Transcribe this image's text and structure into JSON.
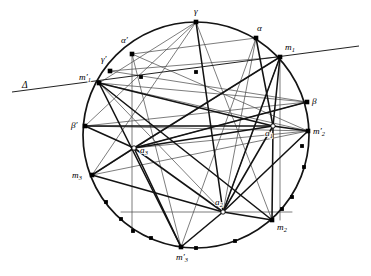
{
  "figure": {
    "background_color": "#ffffff",
    "ink_color": "#131313",
    "thin_ink_color": "#4a4a4a",
    "circle": {
      "cx": 196,
      "cy": 135,
      "r": 113
    },
    "secant": {
      "name": "Delta",
      "label": "Δ",
      "label_x": 22,
      "label_y": 88,
      "x1": 12,
      "y1": 92,
      "x2": 359,
      "y2": 46
    },
    "points": [
      {
        "id": "gamma",
        "label": "γ",
        "sub": "",
        "x": 196,
        "y": 22,
        "lx": 194,
        "ly": 14,
        "marker": "solid"
      },
      {
        "id": "alpha",
        "label": "α",
        "sub": "",
        "x": 256,
        "y": 38,
        "lx": 257,
        "ly": 31,
        "marker": "solid"
      },
      {
        "id": "m1",
        "label": "m",
        "sub": "1",
        "x": 280,
        "y": 57,
        "lx": 285,
        "ly": 50,
        "marker": "solid"
      },
      {
        "id": "beta",
        "label": "β",
        "sub": "",
        "x": 307,
        "y": 102,
        "lx": 312,
        "ly": 104,
        "marker": "solid"
      },
      {
        "id": "m2prime",
        "label": "m′",
        "sub": "2",
        "x": 308,
        "y": 131,
        "lx": 313,
        "ly": 134,
        "marker": "solid"
      },
      {
        "id": "m2",
        "label": "m",
        "sub": "2",
        "x": 272,
        "y": 220,
        "lx": 277,
        "ly": 230,
        "marker": "solid"
      },
      {
        "id": "m3prime",
        "label": "m′",
        "sub": "3",
        "x": 181,
        "y": 247,
        "lx": 176,
        "ly": 260,
        "marker": "solid"
      },
      {
        "id": "m3",
        "label": "m",
        "sub": "3",
        "x": 92,
        "y": 175,
        "lx": 72,
        "ly": 178,
        "marker": "solid"
      },
      {
        "id": "betaprime",
        "label": "β′",
        "sub": "",
        "x": 85,
        "y": 126,
        "lx": 71,
        "ly": 128,
        "marker": "solid"
      },
      {
        "id": "m1prime",
        "label": "m′",
        "sub": "1",
        "x": 99,
        "y": 83,
        "lx": 79,
        "ly": 80,
        "marker": "solid"
      },
      {
        "id": "gammaprime",
        "label": "γ′",
        "sub": "",
        "x": 110,
        "y": 71,
        "lx": 101,
        "ly": 62,
        "marker": "solid"
      },
      {
        "id": "alphaprime",
        "label": "α′",
        "sub": "",
        "x": 132,
        "y": 54,
        "lx": 121,
        "ly": 43,
        "marker": "solid"
      },
      {
        "id": "a1",
        "label": "a",
        "sub": "1",
        "x": 273,
        "y": 126,
        "lx": 265,
        "ly": 136,
        "marker": "open"
      },
      {
        "id": "a2",
        "label": "a",
        "sub": "2",
        "x": 223,
        "y": 212,
        "lx": 215,
        "ly": 205,
        "marker": "open"
      },
      {
        "id": "a3",
        "label": "a",
        "sub": "3",
        "x": 134,
        "y": 148,
        "lx": 140,
        "ly": 153,
        "marker": "open"
      }
    ],
    "minor_points": [
      {
        "id": "p-top-inner-left",
        "x": 141,
        "y": 77
      },
      {
        "id": "p-top-inner-mid",
        "x": 196,
        "y": 72
      },
      {
        "id": "p-right-upper",
        "x": 302,
        "y": 146
      },
      {
        "id": "p-right-mid",
        "x": 304,
        "y": 167
      },
      {
        "id": "p-right-low",
        "x": 292,
        "y": 197
      },
      {
        "id": "p-right-low2",
        "x": 282,
        "y": 209
      },
      {
        "id": "p-bottom-right",
        "x": 235,
        "y": 241
      },
      {
        "id": "p-bottom-mid",
        "x": 196,
        "y": 248
      },
      {
        "id": "p-bottom-left",
        "x": 151,
        "y": 238
      },
      {
        "id": "p-lower-left",
        "x": 121,
        "y": 219
      },
      {
        "id": "p-lower-left2",
        "x": 106,
        "y": 202
      },
      {
        "id": "p-left-low",
        "x": 133,
        "y": 231
      }
    ],
    "chords_thick": [
      {
        "from": "m1prime",
        "to": "a1",
        "id": "c-m1p-a1"
      },
      {
        "from": "m1prime",
        "to": "m2",
        "id": "c-m1p-m2"
      },
      {
        "from": "m1prime",
        "to": "m3prime",
        "id": "c-m1p-m3p"
      },
      {
        "from": "m1",
        "to": "a1",
        "id": "c-m1-a1"
      },
      {
        "from": "m1",
        "to": "a2",
        "id": "c-m1-a2"
      },
      {
        "from": "m1",
        "to": "a3",
        "id": "c-m1-a3"
      },
      {
        "from": "m2prime",
        "to": "a1",
        "id": "c-m2p-a1"
      },
      {
        "from": "m2prime",
        "to": "a2",
        "id": "c-m2p-a2"
      },
      {
        "from": "m2",
        "to": "a2",
        "id": "c-m2-a2"
      },
      {
        "from": "m2",
        "to": "a1",
        "id": "c-m2-a1"
      },
      {
        "from": "m3",
        "to": "a3",
        "id": "c-m3-a3"
      },
      {
        "from": "m3",
        "to": "a2",
        "id": "c-m3-a2"
      },
      {
        "from": "m3prime",
        "to": "a2",
        "id": "c-m3p-a2"
      },
      {
        "from": "m3prime",
        "to": "a3",
        "id": "c-m3p-a3"
      },
      {
        "from": "betaprime",
        "to": "a3",
        "id": "c-bp-a3"
      },
      {
        "from": "betaprime",
        "to": "a1",
        "id": "c-bp-a1"
      },
      {
        "from": "beta",
        "to": "a3",
        "id": "c-b-a3"
      },
      {
        "from": "alpha",
        "to": "a1",
        "id": "c-a-a1"
      },
      {
        "from": "gamma",
        "to": "a2",
        "id": "c-g-a2"
      },
      {
        "from": "a1",
        "to": "a2",
        "id": "c-a1-a2"
      },
      {
        "from": "a2",
        "to": "a3",
        "id": "c-a2-a3"
      },
      {
        "from": "a3",
        "to": "a1",
        "id": "c-a3-a1"
      }
    ],
    "chords_thin": [
      {
        "from": "alphaprime",
        "to": "alpha",
        "id": "t-ap-a"
      },
      {
        "from": "alphaprime",
        "to": "m2prime",
        "id": "t-ap-m2p"
      },
      {
        "from": "alphaprime",
        "to": "m3prime",
        "id": "t-ap-m3p"
      },
      {
        "from": "gammaprime",
        "to": "beta",
        "id": "t-gp-b"
      },
      {
        "from": "gammaprime",
        "to": "m1",
        "id": "t-gp-m1"
      },
      {
        "from": "gamma",
        "to": "m1prime",
        "id": "t-g-m1p"
      },
      {
        "from": "gamma",
        "to": "betaprime",
        "id": "t-g-bp"
      },
      {
        "from": "gamma",
        "to": "m2",
        "id": "t-g-m2"
      },
      {
        "from": "gamma",
        "to": "m3",
        "id": "t-g-m3"
      },
      {
        "from": "alpha",
        "to": "m3prime",
        "id": "t-a-m3p"
      },
      {
        "from": "alpha",
        "to": "a2",
        "id": "t-a-a2"
      },
      {
        "from": "beta",
        "to": "m1prime",
        "id": "t-b-m1p"
      },
      {
        "from": "beta",
        "to": "betaprime",
        "id": "t-b-bp"
      },
      {
        "from": "betaprime",
        "to": "m2prime",
        "id": "t-bp-m2p"
      },
      {
        "from": "m1prime",
        "to": "m2prime",
        "id": "t-m1p-m2p"
      },
      {
        "from": "m1prime",
        "to": "a2",
        "id": "t-m1p-a2"
      },
      {
        "from": "m3",
        "to": "m1",
        "id": "t-m3-m1"
      },
      {
        "from": "m3",
        "to": "m2prime",
        "id": "t-m3-m2p"
      },
      {
        "from": "a3",
        "to": "m2prime",
        "id": "t-a3-m2p"
      },
      {
        "from": "a3",
        "to": "beta",
        "id": "t-a3-b"
      },
      {
        "from": "a2",
        "to": "m1",
        "id": "t-a2-m1"
      }
    ],
    "vertical_guides": [
      {
        "id": "v-alphaprime",
        "x": 132,
        "y1": 54,
        "y2": 231
      },
      {
        "id": "v-m1",
        "x": 280,
        "y1": 57,
        "y2": 220
      }
    ],
    "horizontal_guides": [
      {
        "id": "h-a2",
        "y": 212,
        "x1": 121,
        "x2": 292
      }
    ]
  }
}
